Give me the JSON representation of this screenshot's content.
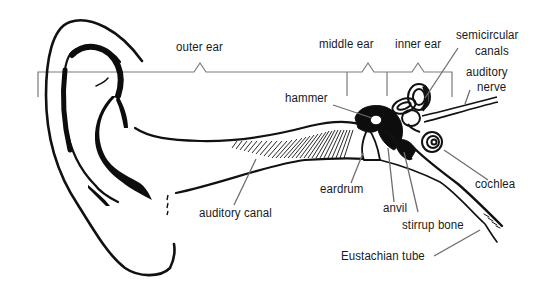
{
  "diagram": {
    "sections": [
      {
        "id": "outer",
        "label": "outer ear"
      },
      {
        "id": "middle",
        "label": "middle ear"
      },
      {
        "id": "inner",
        "label": "inner ear"
      }
    ],
    "parts": {
      "semicircular": {
        "line1": "semicircular",
        "line2": "canals"
      },
      "nerve": {
        "line1": "auditory",
        "line2": "nerve"
      },
      "hammer": "hammer",
      "eardrum": "eardrum",
      "anvil": "anvil",
      "stirrup": "stirrup bone",
      "cochlea": "cochlea",
      "eustachian": "Eustachian tube",
      "canal": "auditory canal"
    },
    "colors": {
      "ink": "#111111",
      "leader": "#6e6e6e",
      "background": "#ffffff"
    }
  }
}
